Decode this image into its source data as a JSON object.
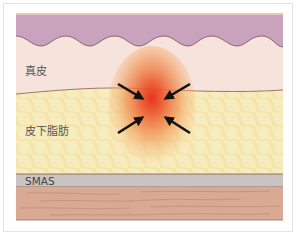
{
  "diagram": {
    "layers": [
      {
        "name": "epidermis",
        "label": "",
        "color": "#c9a3bd"
      },
      {
        "name": "dermis",
        "label": "真皮",
        "color": "#f6e3dc"
      },
      {
        "name": "subcutaneous-fat",
        "label": "皮下脂肪",
        "color": "#f4e5a8"
      },
      {
        "name": "smas",
        "label": "SMAS",
        "color": "#c9c4c1"
      },
      {
        "name": "muscle",
        "label": "",
        "color": "#d9a993"
      }
    ],
    "focus": {
      "description": "Red heat spot at dermis/fat boundary with four inward-pointing arrows",
      "center_color": "#e8321e",
      "arrow_count": 4,
      "arrow_color": "#111111"
    },
    "colors": {
      "frame_border": "#e6e2e0",
      "boundary_line": "#8a5a4a"
    }
  }
}
